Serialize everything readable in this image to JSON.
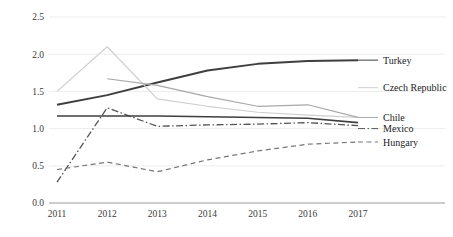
{
  "chart_data": {
    "type": "line",
    "title": "",
    "subtitle": "",
    "xlabel": "",
    "ylabel": "",
    "categories": [
      "2011",
      "2012",
      "2013",
      "2014",
      "2015",
      "2016",
      "2017"
    ],
    "x": [
      2011,
      2012,
      2013,
      2014,
      2015,
      2016,
      2017
    ],
    "xlim": [
      2011,
      2017
    ],
    "ylim": [
      0.0,
      2.5
    ],
    "yticks": [
      "0.0",
      "0.5",
      "1.0",
      "1.5",
      "2.0",
      "2.5"
    ],
    "ytick_values": [
      0.0,
      0.5,
      1.0,
      1.5,
      2.0,
      2.5
    ],
    "grid": "horizontal",
    "legend_position": "right-inline-labels",
    "series": [
      {
        "name": "Turkey",
        "label": "Turkey",
        "color": "#3f3f3f",
        "width": 2.0,
        "dash": "none",
        "start_index": 0,
        "values": [
          1.32,
          1.45,
          1.62,
          1.78,
          1.87,
          1.91,
          1.92
        ],
        "label_y": 1.92
      },
      {
        "name": "Czech Republic",
        "label": "Czech Republic",
        "color": "#cfcfcf",
        "width": 1.2,
        "dash": "none",
        "start_index": 0,
        "values": [
          1.5,
          2.1,
          1.4,
          1.3,
          1.22,
          1.18,
          1.15
        ],
        "label_y": 1.55
      },
      {
        "name": "Chile",
        "label": "Chile",
        "color": "#a8a8a8",
        "width": 1.2,
        "dash": "none",
        "start_index": 1,
        "values": [
          null,
          1.67,
          1.58,
          1.43,
          1.3,
          1.32,
          1.15
        ],
        "label_y": 1.15
      },
      {
        "name": "Mexico",
        "label": "Mexico",
        "color": "#555555",
        "width": 1.3,
        "dash": "dashdot",
        "start_index": 0,
        "values": [
          0.28,
          1.28,
          1.03,
          1.05,
          1.06,
          1.08,
          1.04
        ],
        "label_y": 1.0
      },
      {
        "name": "Hungary",
        "label": "Hungary",
        "color": "#777777",
        "width": 1.2,
        "dash": "dashed",
        "start_index": 0,
        "values": [
          0.45,
          0.55,
          0.42,
          0.58,
          0.7,
          0.79,
          0.82
        ],
        "label_y": 0.82
      },
      {
        "name": "Chile-flat-overlay",
        "label": "",
        "color": "#3f3f3f",
        "width": 1.6,
        "dash": "none",
        "start_index": 0,
        "values": [
          1.17,
          1.17,
          1.17,
          1.16,
          1.15,
          1.14,
          1.08
        ],
        "label_y": null
      }
    ]
  },
  "axis": {
    "y_ticks": [
      "0.0",
      "0.5",
      "1.0",
      "1.5",
      "2.0",
      "2.5"
    ],
    "x_ticks": [
      "2011",
      "2012",
      "2013",
      "2014",
      "2015",
      "2016",
      "2017"
    ]
  },
  "labels": {
    "turkey": "Turkey",
    "czech_republic": "Czech Republic",
    "chile": "Chile",
    "mexico": "Mexico",
    "hungary": "Hungary"
  }
}
